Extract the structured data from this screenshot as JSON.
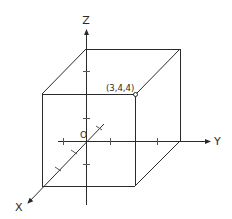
{
  "diagram": {
    "type": "3d-coordinate-cube",
    "axes": {
      "x": {
        "label": "X"
      },
      "y": {
        "label": "Y"
      },
      "z": {
        "label": "Z"
      }
    },
    "origin": {
      "label": "O"
    },
    "point": {
      "label": "(3,4,4)",
      "coords": [
        3,
        4,
        4
      ]
    },
    "colors": {
      "stroke": "#2a2a2a",
      "background": "#ffffff"
    }
  }
}
